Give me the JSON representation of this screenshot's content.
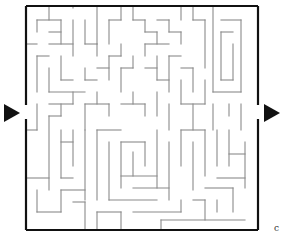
{
  "puzzle": {
    "type": "maze",
    "colors": {
      "background": "#ffffff",
      "border": "#111111",
      "wall": "#8a8a8a",
      "arrow": "#111111"
    },
    "border": {
      "left": 26,
      "top": 6,
      "right": 258,
      "bottom": 230,
      "left_gap": [
        105,
        119
      ],
      "right_gap": [
        105,
        119
      ]
    },
    "entrance_arrow": {
      "label": "entrance-arrow",
      "points": "4,104 4,122 20,113"
    },
    "exit_arrow": {
      "label": "exit-arrow",
      "points": "264,104 264,122 280,113"
    },
    "walls": [
      [
        49,
        6,
        49,
        20
      ],
      [
        37,
        20,
        37,
        32
      ],
      [
        37,
        20,
        61,
        20
      ],
      [
        61,
        20,
        61,
        44
      ],
      [
        49,
        32,
        61,
        32
      ],
      [
        26,
        44,
        37,
        44
      ],
      [
        49,
        44,
        73,
        44
      ],
      [
        73,
        20,
        73,
        56
      ],
      [
        73,
        6,
        73,
        8
      ],
      [
        97,
        6,
        97,
        44
      ],
      [
        85,
        20,
        85,
        44
      ],
      [
        85,
        44,
        97,
        44
      ],
      [
        97,
        44,
        97,
        56
      ],
      [
        109,
        20,
        109,
        44
      ],
      [
        109,
        20,
        121,
        20
      ],
      [
        121,
        6,
        121,
        20
      ],
      [
        133,
        6,
        133,
        20
      ],
      [
        133,
        20,
        145,
        20
      ],
      [
        145,
        20,
        145,
        32
      ],
      [
        157,
        20,
        169,
        20
      ],
      [
        169,
        20,
        169,
        32
      ],
      [
        169,
        32,
        181,
        32
      ],
      [
        181,
        32,
        181,
        44
      ],
      [
        145,
        32,
        157,
        32
      ],
      [
        157,
        32,
        157,
        44
      ],
      [
        145,
        44,
        145,
        56
      ],
      [
        145,
        44,
        169,
        44
      ],
      [
        181,
        6,
        181,
        20
      ],
      [
        193,
        6,
        193,
        20
      ],
      [
        193,
        20,
        205,
        20
      ],
      [
        205,
        20,
        205,
        68
      ],
      [
        213,
        6,
        213,
        92
      ],
      [
        221,
        20,
        241,
        20
      ],
      [
        241,
        20,
        241,
        92
      ],
      [
        221,
        32,
        233,
        32
      ],
      [
        221,
        32,
        221,
        80
      ],
      [
        233,
        44,
        233,
        80
      ],
      [
        221,
        80,
        233,
        80
      ],
      [
        213,
        92,
        241,
        92
      ],
      [
        37,
        56,
        37,
        92
      ],
      [
        37,
        56,
        49,
        56
      ],
      [
        61,
        56,
        61,
        80
      ],
      [
        61,
        80,
        73,
        80
      ],
      [
        49,
        68,
        49,
        92
      ],
      [
        49,
        92,
        85,
        92
      ],
      [
        85,
        68,
        85,
        80
      ],
      [
        85,
        80,
        97,
        80
      ],
      [
        97,
        68,
        109,
        68
      ],
      [
        109,
        56,
        109,
        80
      ],
      [
        109,
        56,
        121,
        56
      ],
      [
        121,
        44,
        121,
        56
      ],
      [
        121,
        68,
        121,
        92
      ],
      [
        121,
        68,
        133,
        68
      ],
      [
        133,
        56,
        133,
        68
      ],
      [
        145,
        68,
        157,
        68
      ],
      [
        157,
        56,
        157,
        80
      ],
      [
        157,
        80,
        169,
        80
      ],
      [
        169,
        56,
        169,
        92
      ],
      [
        169,
        56,
        181,
        56
      ],
      [
        181,
        68,
        193,
        68
      ],
      [
        193,
        68,
        193,
        92
      ],
      [
        181,
        80,
        181,
        104
      ],
      [
        181,
        104,
        205,
        104
      ],
      [
        205,
        80,
        205,
        104
      ],
      [
        37,
        104,
        37,
        130
      ],
      [
        49,
        104,
        73,
        104
      ],
      [
        73,
        92,
        73,
        104
      ],
      [
        61,
        104,
        61,
        116
      ],
      [
        85,
        104,
        85,
        130
      ],
      [
        85,
        104,
        109,
        104
      ],
      [
        97,
        92,
        97,
        104
      ],
      [
        109,
        104,
        109,
        116
      ],
      [
        121,
        104,
        145,
        104
      ],
      [
        133,
        92,
        133,
        104
      ],
      [
        145,
        104,
        145,
        116
      ],
      [
        157,
        92,
        157,
        116
      ],
      [
        169,
        104,
        169,
        130
      ],
      [
        193,
        104,
        193,
        130
      ],
      [
        213,
        104,
        213,
        130
      ],
      [
        229,
        104,
        229,
        116
      ],
      [
        241,
        104,
        241,
        130
      ],
      [
        26,
        130,
        37,
        130
      ],
      [
        49,
        116,
        49,
        190
      ],
      [
        49,
        116,
        61,
        116
      ],
      [
        61,
        130,
        61,
        178
      ],
      [
        61,
        142,
        73,
        142
      ],
      [
        73,
        130,
        73,
        166
      ],
      [
        61,
        178,
        73,
        178
      ],
      [
        85,
        130,
        85,
        200
      ],
      [
        97,
        130,
        97,
        200
      ],
      [
        97,
        130,
        121,
        130
      ],
      [
        109,
        142,
        109,
        200
      ],
      [
        121,
        142,
        121,
        188
      ],
      [
        121,
        142,
        145,
        142
      ],
      [
        133,
        152,
        133,
        176
      ],
      [
        121,
        176,
        157,
        176
      ],
      [
        145,
        142,
        145,
        166
      ],
      [
        157,
        130,
        157,
        188
      ],
      [
        133,
        188,
        169,
        188
      ],
      [
        169,
        142,
        169,
        200
      ],
      [
        181,
        130,
        181,
        166
      ],
      [
        181,
        130,
        205,
        130
      ],
      [
        193,
        142,
        193,
        190
      ],
      [
        205,
        130,
        205,
        176
      ],
      [
        217,
        130,
        217,
        166
      ],
      [
        229,
        130,
        229,
        166
      ],
      [
        229,
        154,
        245,
        154
      ],
      [
        245,
        142,
        245,
        188
      ],
      [
        217,
        178,
        245,
        178
      ],
      [
        205,
        188,
        233,
        188
      ],
      [
        233,
        188,
        233,
        212
      ],
      [
        217,
        200,
        217,
        212
      ],
      [
        26,
        178,
        49,
        178
      ],
      [
        37,
        190,
        37,
        212
      ],
      [
        37,
        212,
        61,
        212
      ],
      [
        61,
        190,
        61,
        212
      ],
      [
        61,
        190,
        85,
        190
      ],
      [
        73,
        202,
        85,
        202
      ],
      [
        85,
        202,
        85,
        230
      ],
      [
        97,
        212,
        121,
        212
      ],
      [
        97,
        212,
        97,
        230
      ],
      [
        109,
        200,
        157,
        200
      ],
      [
        121,
        212,
        121,
        230
      ],
      [
        133,
        212,
        181,
        212
      ],
      [
        181,
        200,
        181,
        212
      ],
      [
        193,
        200,
        205,
        200
      ],
      [
        205,
        200,
        205,
        220
      ],
      [
        161,
        220,
        245,
        220
      ],
      [
        161,
        220,
        161,
        230
      ]
    ],
    "corner_mark": "c"
  }
}
